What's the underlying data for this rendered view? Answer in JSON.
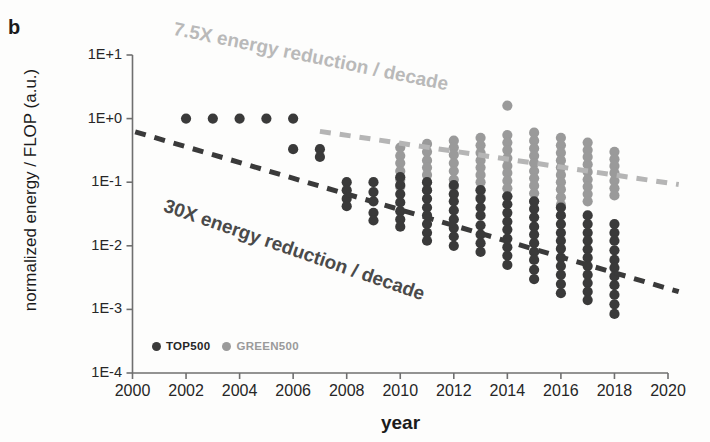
{
  "panel": {
    "letter": "b"
  },
  "axes": {
    "ylabel": "normalized energy / FLOP (a.u.)",
    "xlabel": "year",
    "ytick_labels": [
      "1E+1",
      "1E+0",
      "1E-1",
      "1E-2",
      "1E-3",
      "1E-4"
    ],
    "xtick_labels": [
      "2000",
      "2002",
      "2004",
      "2006",
      "2008",
      "2010",
      "2012",
      "2014",
      "2016",
      "2018",
      "2020"
    ]
  },
  "annotations": {
    "green500_trend_line1": "7.5X energy reduction",
    "green500_trend_line2": "/ decade",
    "top500_trend_line1": "30X energy reduction",
    "top500_trend_line2": "/ decade"
  },
  "legend": {
    "items": [
      {
        "label": "TOP500",
        "color": "#3a3a3a"
      },
      {
        "label": "GREEN500",
        "color": "#9a9a9a"
      }
    ]
  },
  "chart_data": {
    "type": "scatter",
    "title": "",
    "xlabel": "year",
    "ylabel": "normalized energy / FLOP (a.u.)",
    "xlim": [
      2000,
      2020
    ],
    "ylim_log10": [
      -4,
      1
    ],
    "yscale": "log",
    "grid": false,
    "legend_position": "bottom-left",
    "series": [
      {
        "name": "TOP500",
        "color": "#3a3a3a",
        "points": [
          [
            2002,
            1.0
          ],
          [
            2003,
            1.0
          ],
          [
            2004,
            1.0
          ],
          [
            2005,
            1.0
          ],
          [
            2006,
            1.0
          ],
          [
            2006,
            0.33
          ],
          [
            2007,
            0.33
          ],
          [
            2007,
            0.25
          ],
          [
            2008,
            0.1
          ],
          [
            2008,
            0.075
          ],
          [
            2008,
            0.055
          ],
          [
            2008,
            0.042
          ],
          [
            2009,
            0.1
          ],
          [
            2009,
            0.07
          ],
          [
            2009,
            0.05
          ],
          [
            2009,
            0.033
          ],
          [
            2009,
            0.025
          ],
          [
            2010,
            0.12
          ],
          [
            2010,
            0.09
          ],
          [
            2010,
            0.065
          ],
          [
            2010,
            0.048
          ],
          [
            2010,
            0.035
          ],
          [
            2010,
            0.026
          ],
          [
            2010,
            0.02
          ],
          [
            2011,
            0.1
          ],
          [
            2011,
            0.075
          ],
          [
            2011,
            0.055
          ],
          [
            2011,
            0.04
          ],
          [
            2011,
            0.03
          ],
          [
            2011,
            0.022
          ],
          [
            2011,
            0.016
          ],
          [
            2011,
            0.012
          ],
          [
            2012,
            0.09
          ],
          [
            2012,
            0.065
          ],
          [
            2012,
            0.05
          ],
          [
            2012,
            0.036
          ],
          [
            2012,
            0.026
          ],
          [
            2012,
            0.019
          ],
          [
            2012,
            0.014
          ],
          [
            2012,
            0.01
          ],
          [
            2013,
            0.075
          ],
          [
            2013,
            0.055
          ],
          [
            2013,
            0.04
          ],
          [
            2013,
            0.03
          ],
          [
            2013,
            0.021
          ],
          [
            2013,
            0.015
          ],
          [
            2013,
            0.011
          ],
          [
            2013,
            0.008
          ],
          [
            2014,
            0.06
          ],
          [
            2014,
            0.045
          ],
          [
            2014,
            0.033
          ],
          [
            2014,
            0.024
          ],
          [
            2014,
            0.018
          ],
          [
            2014,
            0.013
          ],
          [
            2014,
            0.0095
          ],
          [
            2014,
            0.007
          ],
          [
            2014,
            0.005
          ],
          [
            2015,
            0.05
          ],
          [
            2015,
            0.038
          ],
          [
            2015,
            0.028
          ],
          [
            2015,
            0.02
          ],
          [
            2015,
            0.015
          ],
          [
            2015,
            0.011
          ],
          [
            2015,
            0.008
          ],
          [
            2015,
            0.006
          ],
          [
            2015,
            0.0042
          ],
          [
            2015,
            0.003
          ],
          [
            2016,
            0.04
          ],
          [
            2016,
            0.03
          ],
          [
            2016,
            0.022
          ],
          [
            2016,
            0.016
          ],
          [
            2016,
            0.012
          ],
          [
            2016,
            0.009
          ],
          [
            2016,
            0.0065
          ],
          [
            2016,
            0.0048
          ],
          [
            2016,
            0.0035
          ],
          [
            2016,
            0.0025
          ],
          [
            2016,
            0.0018
          ],
          [
            2017,
            0.03
          ],
          [
            2017,
            0.022
          ],
          [
            2017,
            0.016
          ],
          [
            2017,
            0.012
          ],
          [
            2017,
            0.0088
          ],
          [
            2017,
            0.0065
          ],
          [
            2017,
            0.0048
          ],
          [
            2017,
            0.0035
          ],
          [
            2017,
            0.0026
          ],
          [
            2017,
            0.0019
          ],
          [
            2017,
            0.0014
          ],
          [
            2018,
            0.022
          ],
          [
            2018,
            0.016
          ],
          [
            2018,
            0.012
          ],
          [
            2018,
            0.0085
          ],
          [
            2018,
            0.006
          ],
          [
            2018,
            0.0045
          ],
          [
            2018,
            0.0033
          ],
          [
            2018,
            0.0024
          ],
          [
            2018,
            0.0017
          ],
          [
            2018,
            0.0012
          ],
          [
            2018,
            0.00085
          ]
        ]
      },
      {
        "name": "GREEN500",
        "color": "#9a9a9a",
        "points": [
          [
            2010,
            0.35
          ],
          [
            2010,
            0.26
          ],
          [
            2010,
            0.2
          ],
          [
            2010,
            0.15
          ],
          [
            2010,
            0.11
          ],
          [
            2010,
            0.085
          ],
          [
            2011,
            0.4
          ],
          [
            2011,
            0.3
          ],
          [
            2011,
            0.22
          ],
          [
            2011,
            0.17
          ],
          [
            2011,
            0.13
          ],
          [
            2011,
            0.1
          ],
          [
            2011,
            0.075
          ],
          [
            2012,
            0.45
          ],
          [
            2012,
            0.35
          ],
          [
            2012,
            0.27
          ],
          [
            2012,
            0.2
          ],
          [
            2012,
            0.15
          ],
          [
            2012,
            0.11
          ],
          [
            2012,
            0.085
          ],
          [
            2012,
            0.065
          ],
          [
            2013,
            0.5
          ],
          [
            2013,
            0.38
          ],
          [
            2013,
            0.29
          ],
          [
            2013,
            0.22
          ],
          [
            2013,
            0.17
          ],
          [
            2013,
            0.13
          ],
          [
            2013,
            0.1
          ],
          [
            2013,
            0.075
          ],
          [
            2013,
            0.058
          ],
          [
            2014,
            1.6
          ],
          [
            2014,
            0.55
          ],
          [
            2014,
            0.42
          ],
          [
            2014,
            0.32
          ],
          [
            2014,
            0.24
          ],
          [
            2014,
            0.18
          ],
          [
            2014,
            0.14
          ],
          [
            2014,
            0.105
          ],
          [
            2014,
            0.08
          ],
          [
            2014,
            0.06
          ],
          [
            2015,
            0.6
          ],
          [
            2015,
            0.45
          ],
          [
            2015,
            0.34
          ],
          [
            2015,
            0.26
          ],
          [
            2015,
            0.2
          ],
          [
            2015,
            0.15
          ],
          [
            2015,
            0.115
          ],
          [
            2015,
            0.088
          ],
          [
            2015,
            0.067
          ],
          [
            2015,
            0.05
          ],
          [
            2016,
            0.5
          ],
          [
            2016,
            0.38
          ],
          [
            2016,
            0.29
          ],
          [
            2016,
            0.22
          ],
          [
            2016,
            0.17
          ],
          [
            2016,
            0.13
          ],
          [
            2016,
            0.1
          ],
          [
            2016,
            0.077
          ],
          [
            2016,
            0.058
          ],
          [
            2016,
            0.044
          ],
          [
            2017,
            0.42
          ],
          [
            2017,
            0.32
          ],
          [
            2017,
            0.25
          ],
          [
            2017,
            0.19
          ],
          [
            2017,
            0.145
          ],
          [
            2017,
            0.11
          ],
          [
            2017,
            0.085
          ],
          [
            2017,
            0.065
          ],
          [
            2017,
            0.05
          ],
          [
            2018,
            0.3
          ],
          [
            2018,
            0.23
          ],
          [
            2018,
            0.18
          ],
          [
            2018,
            0.14
          ],
          [
            2018,
            0.105
          ],
          [
            2018,
            0.08
          ],
          [
            2018,
            0.062
          ]
        ]
      }
    ],
    "trendlines": [
      {
        "name": "TOP500 trend",
        "label": "30X energy reduction / decade",
        "color": "#3a3a3a",
        "style": "dashed",
        "x0": 2000.1,
        "y0": 0.62,
        "x1": 2020.4,
        "y1": 0.0019
      },
      {
        "name": "GREEN500 trend",
        "label": "7.5X energy reduction / decade",
        "color": "#b5b5b5",
        "style": "dashed",
        "x0": 2007.0,
        "y0": 0.63,
        "x1": 2020.4,
        "y1": 0.092
      }
    ]
  }
}
